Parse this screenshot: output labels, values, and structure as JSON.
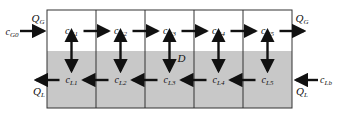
{
  "diagram": {
    "gas_stages": [
      {
        "main": "c",
        "sub": "G1"
      },
      {
        "main": "c",
        "sub": "G2"
      },
      {
        "main": "c",
        "sub": "G3"
      },
      {
        "main": "c",
        "sub": "G4"
      },
      {
        "main": "c",
        "sub": "G5"
      }
    ],
    "liquid_stages": [
      {
        "main": "c",
        "sub": "L1"
      },
      {
        "main": "c",
        "sub": "L2"
      },
      {
        "main": "c",
        "sub": "L3"
      },
      {
        "main": "c",
        "sub": "L4"
      },
      {
        "main": "c",
        "sub": "L5"
      }
    ],
    "gas_inlet": {
      "main": "c",
      "sub": "G0"
    },
    "liquid_inlet": {
      "main": "c",
      "sub": "Lb"
    },
    "gas_flow_left": {
      "main": "Q",
      "sub": "G"
    },
    "gas_flow_right": {
      "main": "Q",
      "sub": "G"
    },
    "liquid_flow_left": {
      "main": "Q",
      "sub": "L"
    },
    "liquid_flow_right": {
      "main": "Q",
      "sub": "L"
    },
    "exchange_label": "D",
    "colors": {
      "gas_phase": "#ffffff",
      "liquid_phase": "#c8c8c8",
      "lines": "#111111"
    }
  }
}
